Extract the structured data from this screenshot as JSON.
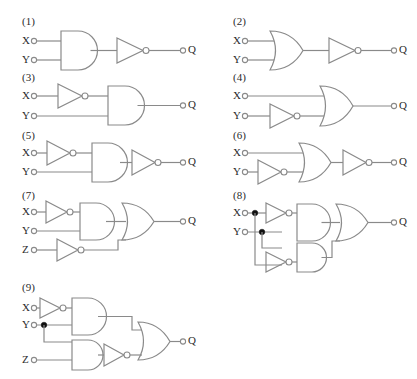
{
  "page": {
    "background_color": "#ffffff",
    "line_color": "#8a8a8a",
    "text_color": "#2b2b2b",
    "junction_color": "#111111",
    "width": 417,
    "height": 379
  },
  "labels": {
    "input_x": "X",
    "input_y": "Y",
    "input_z": "Z",
    "output_q": "Q"
  },
  "circuits": [
    {
      "number": "(1)",
      "inputs": [
        "X",
        "Y"
      ],
      "outputs": [
        "Q"
      ],
      "gates": [
        "and-gate",
        "not-gate"
      ],
      "description": "X and Y into AND gate, output through NOT gate to Q"
    },
    {
      "number": "(2)",
      "inputs": [
        "X",
        "Y"
      ],
      "outputs": [
        "Q"
      ],
      "gates": [
        "or-gate",
        "not-gate"
      ],
      "description": "X and Y into OR gate, output through NOT gate to Q"
    },
    {
      "number": "(3)",
      "inputs": [
        "X",
        "Y"
      ],
      "outputs": [
        "Q"
      ],
      "gates": [
        "not-gate",
        "and-gate"
      ],
      "description": "X through NOT gate, then AND with Y to Q"
    },
    {
      "number": "(4)",
      "inputs": [
        "X",
        "Y"
      ],
      "outputs": [
        "Q"
      ],
      "gates": [
        "not-gate",
        "or-gate"
      ],
      "description": "Y through NOT gate, then OR with X to Q"
    },
    {
      "number": "(5)",
      "inputs": [
        "X",
        "Y"
      ],
      "outputs": [
        "Q"
      ],
      "gates": [
        "not-gate",
        "and-gate",
        "not-gate"
      ],
      "description": "X through NOT gate, AND with Y, output through NOT gate to Q"
    },
    {
      "number": "(6)",
      "inputs": [
        "X",
        "Y"
      ],
      "outputs": [
        "Q"
      ],
      "gates": [
        "not-gate",
        "or-gate",
        "not-gate"
      ],
      "description": "Y through NOT gate, OR with X, output through NOT gate to Q"
    },
    {
      "number": "(7)",
      "inputs": [
        "X",
        "Y",
        "Z"
      ],
      "outputs": [
        "Q"
      ],
      "gates": [
        "not-gate",
        "and-gate",
        "not-gate",
        "or-gate"
      ],
      "description": "X through NOT gate AND Y; Z through NOT gate; both into OR gate to Q"
    },
    {
      "number": "(8)",
      "inputs": [
        "X",
        "Y"
      ],
      "outputs": [
        "Q"
      ],
      "gates": [
        "not-gate",
        "and-gate",
        "not-gate",
        "and-gate",
        "or-gate"
      ],
      "junctions": [
        "X",
        "Y"
      ],
      "description": "X inverted AND Y; Y inverted AND X; both into OR gate to Q"
    },
    {
      "number": "(9)",
      "inputs": [
        "X",
        "Y",
        "Z"
      ],
      "outputs": [
        "Q"
      ],
      "gates": [
        "not-gate",
        "and-gate",
        "and-gate",
        "not-gate",
        "or-gate"
      ],
      "junctions": [
        "Y"
      ],
      "description": "X inverted AND Y; Y AND Z through NOT gate; both into OR gate to Q"
    }
  ]
}
